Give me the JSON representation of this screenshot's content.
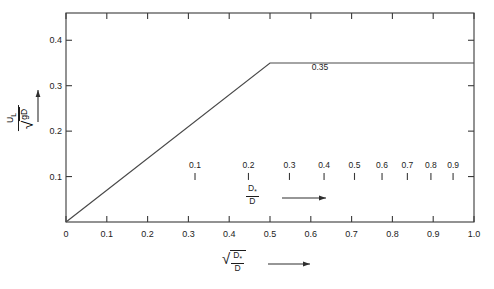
{
  "chart_data": {
    "type": "line",
    "title": "",
    "xlabel": "sqrt(D*/D)",
    "ylabel": "U_L / sqrt(gD)",
    "xlim": [
      0,
      1.0
    ],
    "ylim": [
      0,
      0.46
    ],
    "grid": false,
    "legend": "none",
    "series": [
      {
        "name": "U_L/sqrt(gD)",
        "x": [
          0.0,
          0.5,
          1.0
        ],
        "y": [
          0.0,
          0.35,
          0.35
        ]
      }
    ],
    "annotations": [
      {
        "text": "0.35",
        "x": 0.62,
        "y": 0.375
      }
    ],
    "x_ticks": [
      0,
      0.1,
      0.2,
      0.3,
      0.4,
      0.5,
      0.6,
      0.7,
      0.8,
      0.9,
      1.0
    ],
    "x_tick_labels": [
      "0",
      "0.1",
      "0.2",
      "0.3",
      "0.4",
      "0.5",
      "0.6",
      "0.7",
      "0.8",
      "0.9",
      "1.0"
    ],
    "y_ticks": [
      0.1,
      0.2,
      0.3,
      0.4
    ],
    "y_tick_labels": [
      "0.1",
      "0.2",
      "0.3",
      "0.4"
    ],
    "secondary_axis": {
      "label": "D*/D",
      "values": [
        0.1,
        0.2,
        0.3,
        0.4,
        0.5,
        0.6,
        0.7,
        0.8,
        0.9
      ],
      "labels": [
        "0.1",
        "0.2",
        "0.3",
        "0.4",
        "0.5",
        "0.6",
        "0.7",
        "0.8",
        "0.9"
      ],
      "positions": [
        0.3162,
        0.4472,
        0.5477,
        0.6325,
        0.7071,
        0.7746,
        0.8367,
        0.8944,
        0.9487
      ],
      "y_position": 0.108
    }
  },
  "labels": {
    "ylabel_num": "U",
    "ylabel_num_sub": "L",
    "ylabel_den_radicand": "gD",
    "xlabel_num": "D",
    "xlabel_num_sub": "*",
    "xlabel_den": "D",
    "inner_num": "D",
    "inner_num_sub": "*",
    "inner_den": "D",
    "plateau_value": "0.35"
  }
}
